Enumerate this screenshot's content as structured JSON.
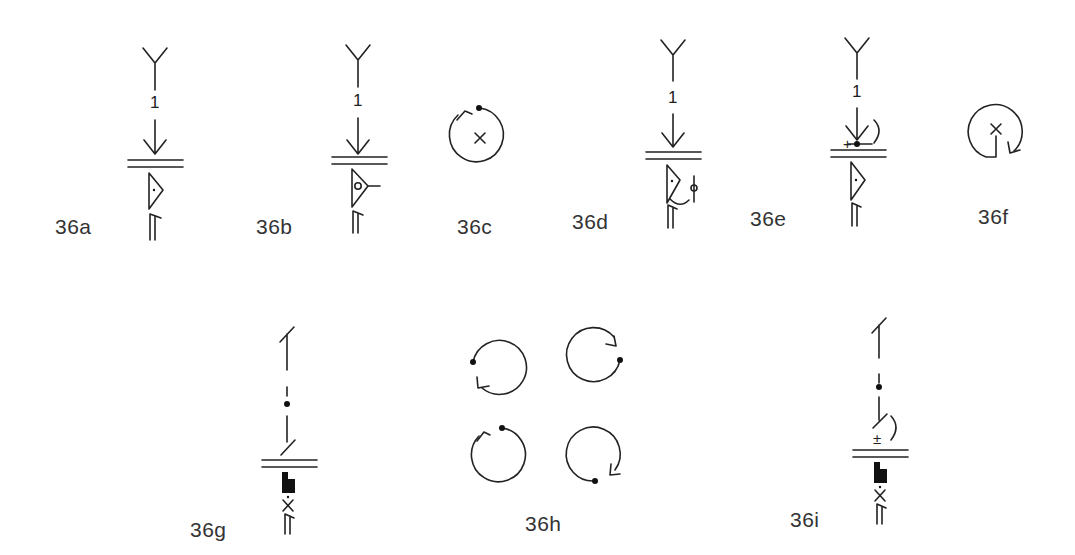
{
  "figure": {
    "labels": {
      "a": "36a",
      "b": "36b",
      "c": "36c",
      "d": "36d",
      "e": "36e",
      "f": "36f",
      "g": "36g",
      "h": "36h",
      "i": "36i"
    },
    "numbers": {
      "a": "1",
      "b": "1",
      "d": "1",
      "e": "1"
    },
    "marks": {
      "e_plus": "+",
      "i_plusminus": "±"
    }
  }
}
